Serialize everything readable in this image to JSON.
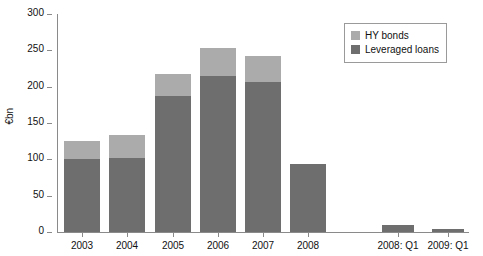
{
  "chart_data": {
    "type": "bar",
    "title": "",
    "subtitle": "",
    "xlabel": "",
    "ylabel": "€bn",
    "ylim": [
      0,
      300
    ],
    "ytick_values": [
      0,
      50,
      100,
      150,
      200,
      250,
      300
    ],
    "ytick_labels": [
      "0",
      "50",
      "100",
      "150",
      "200",
      "250",
      "300"
    ],
    "grid": false,
    "stacked": true,
    "legend_position": "top-right",
    "categories": [
      "2003",
      "2004",
      "2005",
      "2006",
      "2007",
      "2008",
      "2008: Q1",
      "2009: Q1"
    ],
    "series": [
      {
        "name": "Leveraged loans",
        "color": "#6e6e6e",
        "values": [
          101,
          102,
          187,
          215,
          207,
          93,
          10,
          4
        ]
      },
      {
        "name": "HY bonds",
        "color": "#ababab",
        "values": [
          24,
          32,
          31,
          38,
          35,
          0,
          0,
          0
        ]
      }
    ],
    "totals": [
      125,
      134,
      218,
      253,
      242,
      93,
      10,
      4
    ]
  },
  "legend": {
    "items": [
      {
        "label": "HY bonds",
        "color": "#ababab"
      },
      {
        "label": "Leveraged loans",
        "color": "#6e6e6e"
      }
    ]
  }
}
